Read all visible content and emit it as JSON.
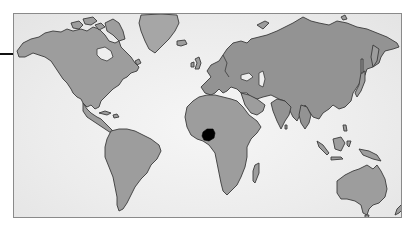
{
  "map": {
    "type": "world-map",
    "style": "grayscale illustration",
    "highlighted_region": {
      "name": "Nigeria",
      "continent": "Africa",
      "color": "#000000"
    },
    "colors": {
      "land": "#9d9d9d",
      "coastline": "#3a3a3a",
      "ocean": "#f2f2f2",
      "frame_border": "#8a8a8a",
      "pointer_line": "#111111"
    },
    "continents": [
      {
        "name": "North America"
      },
      {
        "name": "South America"
      },
      {
        "name": "Greenland"
      },
      {
        "name": "Europe"
      },
      {
        "name": "Africa"
      },
      {
        "name": "Asia"
      },
      {
        "name": "Australia"
      },
      {
        "name": "Madagascar"
      },
      {
        "name": "Indonesia"
      },
      {
        "name": "Japan"
      },
      {
        "name": "New Zealand"
      }
    ]
  }
}
